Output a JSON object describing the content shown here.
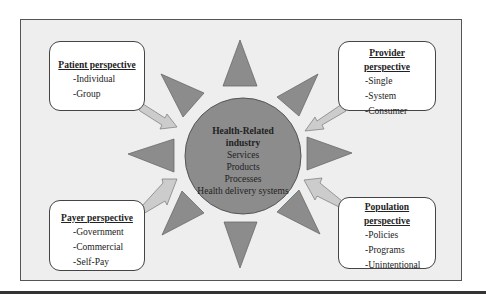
{
  "colors": {
    "frame_background": "#eeeeee",
    "shape_fill": "#8c8c8c",
    "arrow_fill": "#cccccc",
    "box_background": "#ffffff"
  },
  "center": {
    "title_line1": "Health-Related",
    "title_line2": "industry",
    "items": [
      "Services",
      "Products",
      "Processes",
      "Health delivery systems"
    ]
  },
  "perspectives": {
    "patient": {
      "title": "Patient perspective",
      "items": [
        "-Individual",
        "-Group"
      ]
    },
    "provider": {
      "title_line1": "Provider",
      "title_line2": "perspective",
      "items": [
        "-Single",
        "-System",
        "-Consumer"
      ]
    },
    "payer": {
      "title": "Payer perspective",
      "items": [
        "-Government",
        "-Commercial",
        "-Self-Pay"
      ]
    },
    "population": {
      "title_line1": "Population",
      "title_line2": "perspective",
      "items": [
        "-Policies",
        "-Programs",
        "-Unintentional"
      ]
    }
  }
}
